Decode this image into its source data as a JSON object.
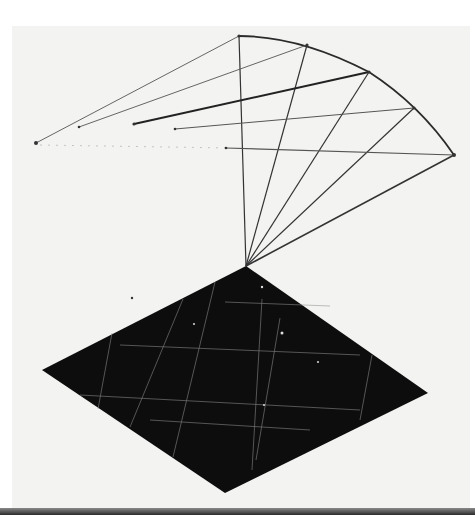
{
  "image": {
    "description": "Photograph of a geometric drawing: a fan of lines radiating from a point above a solid black diamond with a faint white grid",
    "colors": {
      "background": "#ffffff",
      "paper": "#f3f3f1",
      "ink": "#2b2b2b",
      "diamond_fill": "#0d0d0d",
      "grid": "#bfbfbf",
      "bottom_strip": "#2a2a2a"
    }
  }
}
